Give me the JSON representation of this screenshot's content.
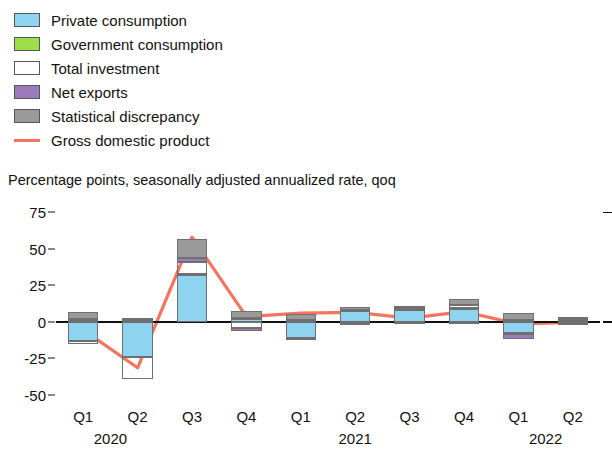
{
  "legend": {
    "items": [
      {
        "label": "Private consumption",
        "color": "#8ed4f0",
        "type": "bar",
        "icon": "legend-swatch"
      },
      {
        "label": "Government consumption",
        "color": "#9ede4c",
        "type": "bar",
        "icon": "legend-swatch"
      },
      {
        "label": "Total investment",
        "color": "#f5a council",
        "type": "bar",
        "icon": "legend-swatch"
      },
      {
        "label": "Net exports",
        "color": "#9b7bba",
        "type": "bar",
        "icon": "legend-swatch"
      },
      {
        "label": "Statistical discrepancy",
        "color": "#9a9a9a",
        "type": "bar",
        "icon": "legend-swatch"
      },
      {
        "label": "Gross domestic product",
        "color": "#f4755f",
        "type": "line",
        "icon": "legend-line"
      }
    ]
  },
  "subtitle": "Percentage points, seasonally adjusted annualized rate, qoq",
  "axis": {
    "y_ticks": [
      "75",
      "50",
      "25",
      "0",
      "-25",
      "-50"
    ],
    "y_tick_values": [
      75,
      50,
      25,
      0,
      -25,
      -50
    ],
    "ylim": [
      -57,
      80
    ],
    "x_labels": [
      "Q1",
      "Q2",
      "Q3",
      "Q4",
      "Q1",
      "Q2",
      "Q3",
      "Q4",
      "Q1",
      "Q2"
    ],
    "year_labels": [
      {
        "label": "2020",
        "index": 0.5
      },
      {
        "label": "2021",
        "index": 5.0
      },
      {
        "label": "2022",
        "index": 8.5
      }
    ]
  },
  "chart_data": {
    "type": "bar",
    "title": "",
    "subtitle": "Percentage points, seasonally adjusted annualized rate, qoq",
    "xlabel": "",
    "ylabel": "",
    "ylim": [
      -57,
      80
    ],
    "grid": false,
    "legend_position": "top-left",
    "stacked": true,
    "categories": [
      "Q1 2020",
      "Q2 2020",
      "Q3 2020",
      "Q4 2020",
      "Q1 2021",
      "Q2 2021",
      "Q3 2021",
      "Q4 2021",
      "Q1 2022",
      "Q2 2022"
    ],
    "series": [
      {
        "name": "Private consumption",
        "color": "#8ed4f0",
        "values": [
          -13.0,
          -24.0,
          32.0,
          2.0,
          -11.0,
          7.5,
          8.0,
          9.0,
          -8.0,
          1.5
        ]
      },
      {
        "name": "Government consumption",
        "color": "#9ede4c",
        "values": [
          0.6,
          1.0,
          1.0,
          0.4,
          0.5,
          0.5,
          0.5,
          0.3,
          -0.5,
          -0.4
        ]
      },
      {
        "name": "Total investment",
        "color": "#f5a councila",
        "values": [
          -2.0,
          -15.0,
          8.0,
          -4.0,
          1.0,
          -1.0,
          1.0,
          2.0,
          1.0,
          -1.5
        ]
      },
      {
        "name": "Net exports",
        "color": "#9b7bba",
        "values": [
          1.0,
          1.0,
          3.0,
          -2.0,
          -1.0,
          -1.5,
          -1.0,
          -1.0,
          -3.0,
          1.0
        ]
      },
      {
        "name": "Statistical discrepancy",
        "color": "#9a9a9a",
        "values": [
          5.0,
          0.5,
          13.0,
          5.0,
          4.0,
          2.0,
          1.5,
          4.5,
          5.0,
          0.5
        ]
      }
    ],
    "line_series": {
      "name": "Gross domestic product",
      "color": "#f4755f",
      "values": [
        -5.5,
        -31.5,
        58.0,
        3.5,
        6.0,
        6.5,
        2.5,
        7.0,
        -1.5,
        -0.5
      ]
    }
  }
}
